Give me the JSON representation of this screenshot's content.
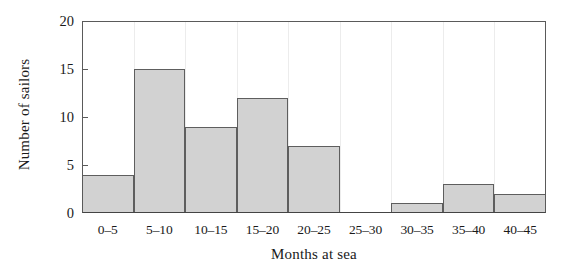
{
  "chart_data": {
    "type": "bar",
    "title": "",
    "xlabel": "Months at sea",
    "ylabel": "Number of sailors",
    "categories": [
      "0–5",
      "5–10",
      "10–15",
      "15–20",
      "20–25",
      "25–30",
      "30–35",
      "35–40",
      "40–45"
    ],
    "values": [
      4,
      15,
      9,
      12,
      7,
      0,
      1,
      3,
      2
    ],
    "ylim": [
      0,
      20
    ],
    "yticks": [
      0,
      5,
      10,
      15,
      20
    ],
    "ytick_labels": [
      "0",
      "5",
      "10",
      "15",
      "20"
    ],
    "grid": "vertical-only",
    "legend": "none",
    "bar_fill_color": "#d2d2d2",
    "bar_edge_color": "#5e5e5e",
    "axis_color": "#5a5a5a",
    "gridline_color": "#ececec",
    "background_color": "#ffffff"
  }
}
